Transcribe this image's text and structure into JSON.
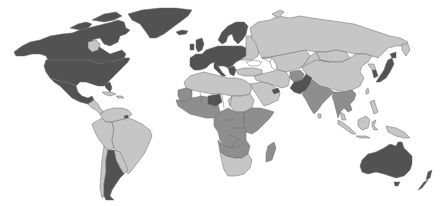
{
  "map": {
    "type": "choropleth",
    "projection": "world",
    "palette": {
      "dark": "#525252",
      "mid": "#8e8e8e",
      "light": "#c6c6c6",
      "background": "#ffffff",
      "border": "#6a6a6a"
    },
    "regions": [
      {
        "name": "Canada",
        "shade": "dark"
      },
      {
        "name": "United States",
        "shade": "dark"
      },
      {
        "name": "Greenland",
        "shade": "dark"
      },
      {
        "name": "Mexico",
        "shade": "dark"
      },
      {
        "name": "Central America",
        "shade": "light"
      },
      {
        "name": "Caribbean",
        "shade": "light"
      },
      {
        "name": "Brazil",
        "shade": "light"
      },
      {
        "name": "Northern South America",
        "shade": "light"
      },
      {
        "name": "Peru / Bolivia",
        "shade": "light"
      },
      {
        "name": "Paraguay / Uruguay",
        "shade": "light"
      },
      {
        "name": "Chile",
        "shade": "light"
      },
      {
        "name": "Argentina",
        "shade": "dark"
      },
      {
        "name": "French Guiana",
        "shade": "dark"
      },
      {
        "name": "Western Europe",
        "shade": "dark"
      },
      {
        "name": "Scandinavia",
        "shade": "dark"
      },
      {
        "name": "Iceland",
        "shade": "dark"
      },
      {
        "name": "United Kingdom / Ireland",
        "shade": "dark"
      },
      {
        "name": "Eastern Europe",
        "shade": "light"
      },
      {
        "name": "Russia",
        "shade": "light"
      },
      {
        "name": "Central Asia",
        "shade": "light"
      },
      {
        "name": "Mongolia",
        "shade": "light"
      },
      {
        "name": "China",
        "shade": "light"
      },
      {
        "name": "Japan",
        "shade": "dark"
      },
      {
        "name": "South Korea",
        "shade": "dark"
      },
      {
        "name": "Middle East",
        "shade": "light"
      },
      {
        "name": "Arabian Peninsula",
        "shade": "light"
      },
      {
        "name": "UAE / Qatar",
        "shade": "dark"
      },
      {
        "name": "Afghanistan",
        "shade": "mid"
      },
      {
        "name": "Pakistan",
        "shade": "dark"
      },
      {
        "name": "India",
        "shade": "mid"
      },
      {
        "name": "Southeast Asia",
        "shade": "mid"
      },
      {
        "name": "Indonesia",
        "shade": "light"
      },
      {
        "name": "Philippines",
        "shade": "light"
      },
      {
        "name": "Papua New Guinea",
        "shade": "light"
      },
      {
        "name": "North Africa",
        "shade": "light"
      },
      {
        "name": "West Africa",
        "shade": "mid"
      },
      {
        "name": "Central Africa",
        "shade": "mid"
      },
      {
        "name": "East Africa",
        "shade": "mid"
      },
      {
        "name": "Southern Africa",
        "shade": "light"
      },
      {
        "name": "Madagascar",
        "shade": "mid"
      },
      {
        "name": "Australia",
        "shade": "dark"
      },
      {
        "name": "New Zealand",
        "shade": "dark"
      }
    ]
  }
}
